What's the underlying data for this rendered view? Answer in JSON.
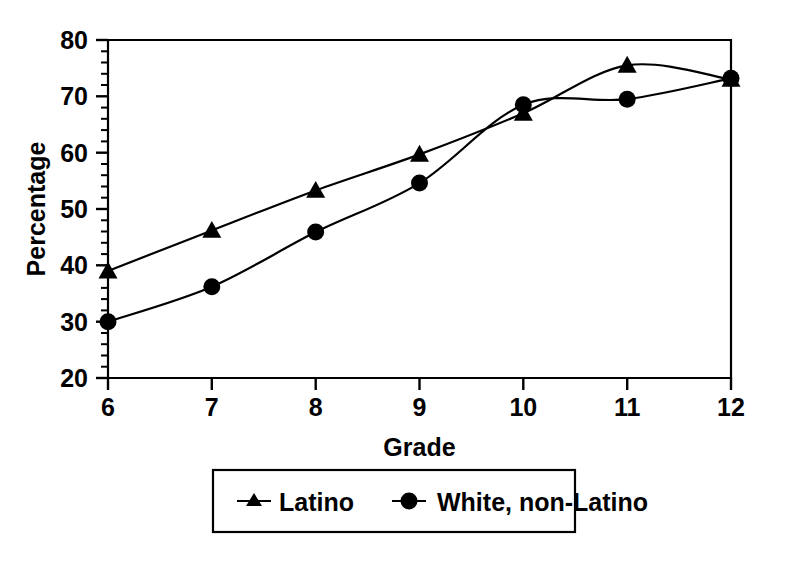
{
  "chart_data": {
    "type": "line",
    "title": "",
    "xlabel": "Grade",
    "ylabel": "Percentage",
    "categories": [
      "6",
      "7",
      "8",
      "9",
      "10",
      "11",
      "12"
    ],
    "x": [
      6,
      7,
      8,
      9,
      10,
      11,
      12
    ],
    "xlim": [
      6,
      12
    ],
    "ylim": [
      20,
      80
    ],
    "y_major_ticks": [
      20,
      30,
      40,
      50,
      60,
      70,
      80
    ],
    "y_minor_tick_step": 2,
    "x_ticks": [
      6,
      7,
      8,
      9,
      10,
      11,
      12
    ],
    "grid": false,
    "legend_position": "below-center",
    "series": [
      {
        "name": "Latino",
        "marker": "triangle",
        "color": "#000000",
        "values": [
          39.0,
          46.2,
          53.3,
          59.7,
          67.0,
          75.5,
          73.0
        ]
      },
      {
        "name": "White, non-Latino",
        "marker": "circle",
        "color": "#000000",
        "values": [
          30.0,
          36.2,
          45.9,
          54.6,
          68.5,
          69.5,
          73.2
        ]
      }
    ]
  },
  "axes": {
    "y_tick_labels": [
      "80",
      "70",
      "60",
      "50",
      "40",
      "30",
      "20"
    ],
    "x_tick_labels": [
      "6",
      "7",
      "8",
      "9",
      "10",
      "11",
      "12"
    ],
    "y_title": "Percentage",
    "x_title": "Grade"
  },
  "legend": {
    "items": [
      {
        "label": "Latino",
        "marker": "triangle-marker-icon"
      },
      {
        "label": "White, non-Latino",
        "marker": "circle-marker-icon"
      }
    ]
  },
  "style": {
    "line_color": "#000000",
    "frame_color": "#000000",
    "background": "#ffffff"
  }
}
